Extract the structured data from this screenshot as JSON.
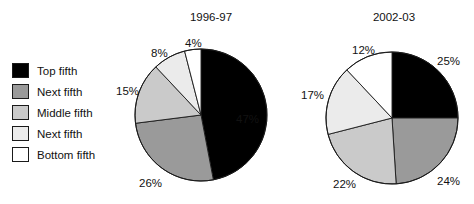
{
  "figure": {
    "background": "#ffffff",
    "legend": {
      "items": [
        {
          "label": "Top fifth",
          "color": "#000000",
          "swatch_name": "legend-swatch-top-fifth"
        },
        {
          "label": "Next fifth",
          "color": "#9a9a9a",
          "swatch_name": "legend-swatch-next-fifth-upper"
        },
        {
          "label": "Middle fifth",
          "color": "#cacaca",
          "swatch_name": "legend-swatch-middle-fifth"
        },
        {
          "label": "Next fifth",
          "color": "#ebebeb",
          "swatch_name": "legend-swatch-next-fifth-lower"
        },
        {
          "label": "Bottom fifth",
          "color": "#ffffff",
          "swatch_name": "legend-swatch-bottom-fifth"
        }
      ]
    }
  },
  "chart_data": [
    {
      "type": "pie",
      "title": "1996-97",
      "categories": [
        "Top fifth",
        "Next fifth",
        "Middle fifth",
        "Next fifth",
        "Bottom fifth"
      ],
      "values": [
        47,
        26,
        15,
        8,
        4
      ],
      "labels": [
        "47%",
        "26%",
        "15%",
        "8%",
        "4%"
      ],
      "colors": [
        "#000000",
        "#9a9a9a",
        "#cacaca",
        "#ebebeb",
        "#ffffff"
      ],
      "start_angle_deg": 0,
      "direction": "clockwise",
      "legend_position": "left",
      "grid": false,
      "xlabel": "",
      "ylabel": ""
    },
    {
      "type": "pie",
      "title": "2002-03",
      "categories": [
        "Top fifth",
        "Next fifth",
        "Middle fifth",
        "Next fifth",
        "Bottom fifth"
      ],
      "values": [
        25,
        24,
        22,
        17,
        12
      ],
      "labels": [
        "25%",
        "24%",
        "22%",
        "17%",
        "12%"
      ],
      "colors": [
        "#000000",
        "#9a9a9a",
        "#cacaca",
        "#ebebeb",
        "#ffffff"
      ],
      "start_angle_deg": 0,
      "direction": "clockwise",
      "legend_position": "left",
      "grid": false,
      "xlabel": "",
      "ylabel": ""
    }
  ],
  "callouts": {
    "left": [
      {
        "text": "47%",
        "x": 236,
        "y": 113
      },
      {
        "text": "26%",
        "x": 139,
        "y": 177
      },
      {
        "text": "15%",
        "x": 116,
        "y": 85
      },
      {
        "text": "8%",
        "x": 151,
        "y": 47
      },
      {
        "text": "4%",
        "x": 185,
        "y": 37
      }
    ],
    "right": [
      {
        "text": "25%",
        "x": 437,
        "y": 55
      },
      {
        "text": "24%",
        "x": 437,
        "y": 175
      },
      {
        "text": "22%",
        "x": 333,
        "y": 178
      },
      {
        "text": "17%",
        "x": 301,
        "y": 89
      },
      {
        "text": "12%",
        "x": 352,
        "y": 44
      }
    ]
  }
}
